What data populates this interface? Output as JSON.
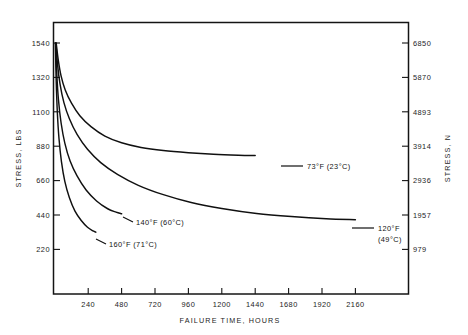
{
  "chart_data": {
    "type": "line",
    "title": "",
    "xlabel": "FAILURE TIME, HOURS",
    "ylabel": "STRESS, LBS",
    "ylabel_secondary": "STRESS, N",
    "xlim": [
      0,
      2400
    ],
    "ylim": [
      0,
      1650
    ],
    "ylim_secondary": [
      0,
      7340
    ],
    "grid": false,
    "legend_position": "inline-annotations",
    "xticks": [
      240,
      480,
      720,
      960,
      1200,
      1440,
      1680,
      1920,
      2160
    ],
    "xtick_labels": [
      "240",
      "480",
      "720",
      "960",
      "1200",
      "1440",
      "1680",
      "1920",
      "2160"
    ],
    "yticks": [
      220,
      440,
      660,
      880,
      1100,
      1320,
      1540
    ],
    "ytick_labels": [
      "220",
      "440",
      "660",
      "880",
      "1100",
      "1320",
      "1540"
    ],
    "yticks_secondary": [
      979,
      1957,
      2936,
      3914,
      4893,
      5870,
      6850
    ],
    "ytick_labels_secondary": [
      "979",
      "1957",
      "2936",
      "3914",
      "4893",
      "5870",
      "6850"
    ],
    "series": [
      {
        "name": "73°F (23°C)",
        "label_line1": "73°F (23°C)",
        "label_line2": "",
        "x": [
          10,
          25,
          45,
          75,
          120,
          180,
          260,
          360,
          480,
          620,
          780,
          960,
          1140,
          1320,
          1440
        ],
        "y": [
          1540,
          1430,
          1330,
          1240,
          1155,
          1075,
          1005,
          945,
          902,
          872,
          852,
          838,
          828,
          822,
          820
        ]
      },
      {
        "name": "120°F (49°C)",
        "label_line1": "120°F",
        "label_line2": "(49°C)",
        "x": [
          8,
          20,
          38,
          65,
          105,
          160,
          235,
          330,
          450,
          600,
          780,
          980,
          1200,
          1450,
          1700,
          1950,
          2160
        ],
        "y": [
          1540,
          1400,
          1275,
          1160,
          1055,
          955,
          860,
          775,
          700,
          630,
          570,
          520,
          482,
          450,
          430,
          416,
          410
        ]
      },
      {
        "name": "140°F (60°C)",
        "label_line1": "140°F (60°C)",
        "label_line2": "",
        "x": [
          6,
          14,
          26,
          45,
          72,
          110,
          160,
          225,
          300,
          380,
          440,
          480
        ],
        "y": [
          1540,
          1350,
          1180,
          1030,
          900,
          785,
          690,
          600,
          530,
          480,
          458,
          448
        ]
      },
      {
        "name": "160°F (71°C)",
        "label_line1": "160°F (71°C)",
        "label_line2": "",
        "x": [
          4,
          10,
          18,
          30,
          48,
          72,
          105,
          145,
          190,
          235,
          275,
          295
        ],
        "y": [
          1540,
          1300,
          1100,
          930,
          780,
          655,
          550,
          465,
          405,
          362,
          338,
          330
        ]
      }
    ],
    "colors": {
      "curve": "#101010",
      "axis": "#141414",
      "background": "#ffffff"
    }
  }
}
